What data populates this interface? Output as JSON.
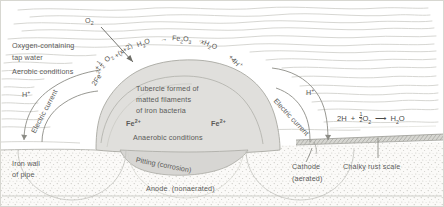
{
  "figure": {
    "colors": {
      "water": "#ffffff",
      "wave_line": "#c9c9c4",
      "tubercle_fill": "#dedddb",
      "tubercle_stroke": "#a8a8a4",
      "pipe_wall": "#f1f0ee",
      "stipple": "#bdbdb8",
      "text": "#55554f",
      "scale_band": "#b9b9b3",
      "border": "#a6a6a0"
    }
  },
  "labels": {
    "oxygen_gas": "O",
    "oxygen_gas_sub": "2",
    "tap_water_line1": "Oxygen-containing",
    "tap_water_line2": "tap water",
    "aerobic": "Aerobic conditions",
    "h_plus_left": "H",
    "h_plus_left_sup": "+",
    "h_plus_right": "H",
    "h_plus_right_sup": "+",
    "electric_current_left": "Electric current",
    "electric_current_right": "Electric current",
    "tubercle_line1": "Tubercle formed of",
    "tubercle_line2": "matted filaments",
    "tubercle_line3": "of iron bacteria",
    "fe2_left": "Fe",
    "fe2_left_sup": "2+",
    "fe2_right": "Fe",
    "fe2_right_sup": "2+",
    "anaerobic": "Anaerobic conditions",
    "pitting": "Pitting (corrosion)",
    "iron_wall_line1": "Iron wall",
    "iron_wall_line2": "of pipe",
    "anode": "Anode  (nonaerated)",
    "cathode_line1": "Cathode",
    "cathode_line2": "(aerated)",
    "chalky_scale": "Chalky rust scale"
  },
  "equations": {
    "tubercle_arc": {
      "full": "2Fe2+ + 1/2 O2 + (x+2)H2O -> Fe2O3·xH2O + 4H+",
      "segments": [
        "2Fe",
        "2+",
        "+",
        "1/2",
        "O",
        "2",
        "+(x+2)H",
        "2",
        "O",
        "→",
        "Fe",
        "2",
        "O",
        "3",
        "·xH",
        "2",
        "O+4H",
        "+"
      ]
    },
    "cathode": {
      "full": "2H + 1/2 O2 → H2O",
      "lead": "2H",
      "plus": "+",
      "half": "1/2",
      "o": "O",
      "o_sub": "2",
      "arrow": "⟶",
      "h": "H",
      "h_sub": "2",
      "o_end": "O"
    }
  }
}
